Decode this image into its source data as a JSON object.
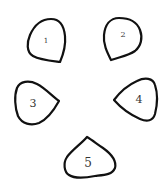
{
  "diagram": {
    "stroke_color": "#111111",
    "background": "#ffffff",
    "petals": [
      {
        "label": "1",
        "tip_direction": "bottom-right"
      },
      {
        "label": "2",
        "tip_direction": "bottom-left"
      },
      {
        "label": "3",
        "tip_direction": "right"
      },
      {
        "label": "4",
        "tip_direction": "left"
      },
      {
        "label": "5",
        "tip_direction": "top"
      }
    ]
  }
}
